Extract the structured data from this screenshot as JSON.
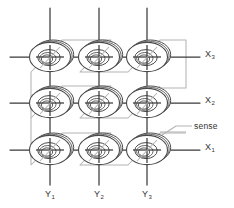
{
  "figure": {
    "type": "core-memory-3x3",
    "colors": {
      "wire_select": "#3a3a3a",
      "wire_sense": "#b0b0b0",
      "core_outline": "#4a4a4a",
      "label_text": "#333333",
      "background": "#ffffff"
    },
    "grid": {
      "rows": 3,
      "cols": 3,
      "col_x": [
        50,
        99,
        147
      ],
      "row_y": [
        57,
        103,
        150
      ],
      "core_rx": 21,
      "core_ry": 15
    }
  },
  "labels": {
    "x_lines": [
      {
        "name": "X",
        "sub": "3",
        "x": 205,
        "y": 54
      },
      {
        "name": "X",
        "sub": "2",
        "x": 205,
        "y": 100
      },
      {
        "name": "X",
        "sub": "1",
        "x": 205,
        "y": 147
      }
    ],
    "y_lines": [
      {
        "name": "Y",
        "sub": "1",
        "x": 45,
        "y": 192
      },
      {
        "name": "Y",
        "sub": "2",
        "x": 94,
        "y": 192
      },
      {
        "name": "Y",
        "sub": "3",
        "x": 142,
        "y": 192
      }
    ],
    "sense": {
      "text": "sense",
      "x": 196,
      "y": 126
    }
  }
}
